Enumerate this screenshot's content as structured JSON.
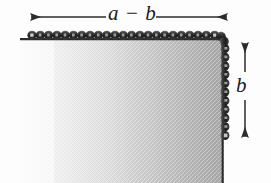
{
  "figure": {
    "name": "chain-draped-rectangular-plate-diagram",
    "type": "technical-illustration",
    "background_color": "#fdfdfd",
    "plate": {
      "name": "gray-plate",
      "fill_gradient_start": "#f7f7f7",
      "fill_gradient_end": "#a9a9a9",
      "edge_color": "#2b2b2b",
      "left_px": 20,
      "top_px": 38,
      "right_px": 224,
      "bottom_px": 183
    },
    "chain": {
      "name": "bead-chain-border",
      "color": "#2a2a2a",
      "highlight_color": "#d8d8d8",
      "bead_count_top": 24,
      "bead_count_right": 12,
      "runs": [
        "top-edge",
        "top-right-corner",
        "right-edge"
      ]
    },
    "dimensions": [
      {
        "id": "width",
        "label": "a − b",
        "orientation": "horizontal",
        "arrow_style": "double-headed",
        "from_px": 30,
        "to_px": 228,
        "axis_px": 17
      },
      {
        "id": "height",
        "label": "b",
        "orientation": "vertical",
        "arrow_style": "double-headed",
        "from_px": 42,
        "to_px": 138,
        "axis_px": 245
      }
    ],
    "line_color": "#2b2b2b"
  }
}
